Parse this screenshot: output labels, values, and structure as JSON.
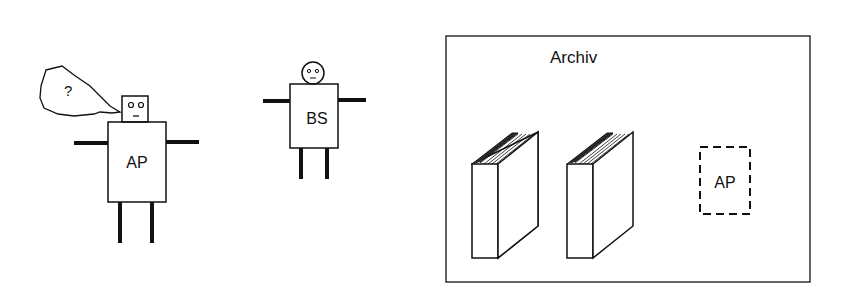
{
  "figure": {
    "actors": [
      {
        "id": "ap",
        "label": "AP",
        "speech_bubble_text": "?"
      },
      {
        "id": "bs",
        "label": "BS"
      }
    ],
    "archive": {
      "title": "Archiv",
      "books_count": 2,
      "placeholder_label": "AP"
    }
  }
}
